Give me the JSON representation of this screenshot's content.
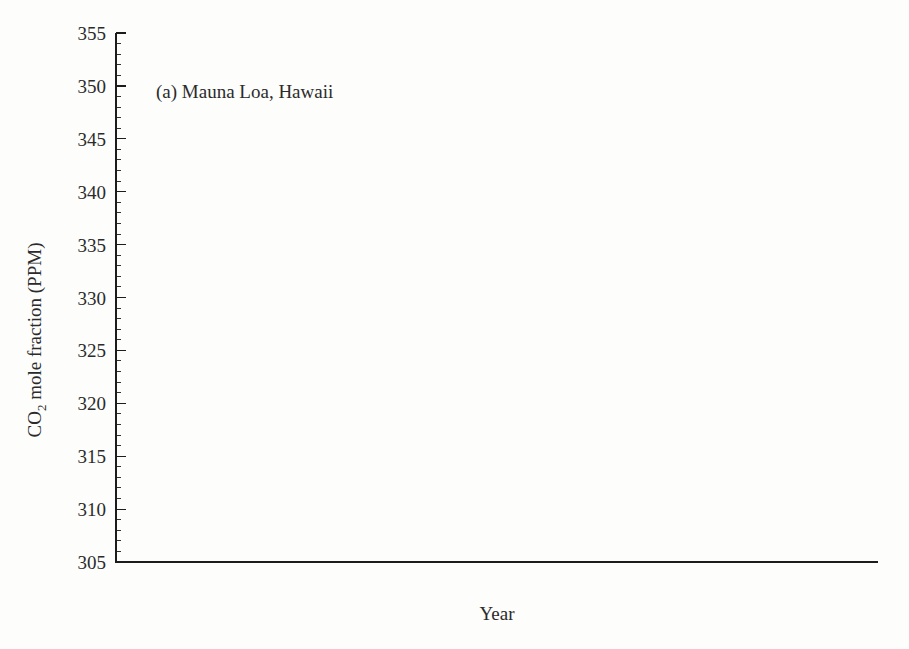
{
  "chart_data": {
    "type": "line",
    "title": "(a) Mauna Loa, Hawaii",
    "panel_letter": "(a)",
    "station": "Mauna Loa, Hawaii",
    "xlabel": "Year",
    "ylabel_prefix": "CO",
    "ylabel_subscript": "2",
    "ylabel_suffix": " mole fraction (PPM)",
    "ylabel": "CO2 mole fraction (PPM)",
    "xlim": [
      57.0,
      85.2
    ],
    "ylim": [
      305,
      355
    ],
    "x_tick_labels": [
      "58",
      "60",
      "62",
      "64",
      "66",
      "68",
      "70",
      "72",
      "74",
      "76",
      "78",
      "80",
      "82",
      "84"
    ],
    "x_tick_values": [
      58,
      60,
      62,
      64,
      66,
      68,
      70,
      72,
      74,
      76,
      78,
      80,
      82,
      84
    ],
    "x_minor_step": 0.25,
    "y_tick_labels": [
      "305",
      "310",
      "315",
      "320",
      "325",
      "330",
      "335",
      "340",
      "345",
      "350",
      "355"
    ],
    "y_tick_values": [
      305,
      310,
      315,
      320,
      325,
      330,
      335,
      340,
      345,
      350,
      355
    ],
    "y_minor_step": 1,
    "grid": false,
    "legend": false,
    "marker": "filled-circle",
    "line_color": "#262626",
    "marker_color": "#111111",
    "series": [
      {
        "name": "Monthly mean CO2 mole fraction",
        "x": [
          1958.208,
          1958.292,
          1958.375,
          1958.458,
          1958.542,
          1958.625,
          1958.708,
          1958.792,
          1958.875,
          1958.958,
          1959.042,
          1959.125,
          1959.208,
          1959.292,
          1959.375,
          1959.458,
          1959.542,
          1959.625,
          1959.708,
          1959.792,
          1959.875,
          1959.958,
          1960.042,
          1960.125,
          1960.208,
          1960.292,
          1960.375,
          1960.458,
          1960.542,
          1960.625,
          1960.708,
          1960.792,
          1960.875,
          1960.958,
          1961.042,
          1961.125,
          1961.208,
          1961.292,
          1961.375,
          1961.458,
          1961.542,
          1961.625,
          1961.708,
          1961.792,
          1961.875,
          1961.958,
          1962.042,
          1962.125,
          1962.208,
          1962.292,
          1962.375,
          1962.458,
          1962.542,
          1962.625,
          1962.708,
          1962.792,
          1962.875,
          1962.958,
          1963.042,
          1963.125,
          1963.208,
          1963.292,
          1963.375,
          1963.458,
          1963.542,
          1963.625,
          1963.708,
          1963.792,
          1963.875,
          1963.958,
          1964.042,
          1964.125,
          1964.208,
          1964.292,
          1964.375,
          1964.458,
          1964.542,
          1964.625,
          1964.708,
          1964.792,
          1964.875,
          1964.958,
          1965.042,
          1965.125,
          1965.208,
          1965.292,
          1965.375,
          1965.458,
          1965.542,
          1965.625,
          1965.708,
          1965.792,
          1965.875,
          1965.958,
          1966.042,
          1966.125,
          1966.208,
          1966.292,
          1966.375,
          1966.458,
          1966.542,
          1966.625,
          1966.708,
          1966.792,
          1966.875,
          1966.958,
          1967.042,
          1967.125,
          1967.208,
          1967.292,
          1967.375,
          1967.458,
          1967.542,
          1967.625,
          1967.708,
          1967.792,
          1967.875,
          1967.958,
          1968.042,
          1968.125,
          1968.208,
          1968.292,
          1968.375,
          1968.458,
          1968.542,
          1968.625,
          1968.708,
          1968.792,
          1968.875,
          1968.958,
          1969.042,
          1969.125,
          1969.208,
          1969.292,
          1969.375,
          1969.458,
          1969.542,
          1969.625,
          1969.708,
          1969.792,
          1969.875,
          1969.958,
          1970.042,
          1970.125,
          1970.208,
          1970.292,
          1970.375,
          1970.458,
          1970.542,
          1970.625,
          1970.708,
          1970.792,
          1970.875,
          1970.958,
          1971.042,
          1971.125,
          1971.208,
          1971.292,
          1971.375,
          1971.458,
          1971.542,
          1971.625,
          1971.708,
          1971.792,
          1971.875,
          1971.958,
          1972.042,
          1972.125,
          1972.208,
          1972.292,
          1972.375,
          1972.458,
          1972.542,
          1972.625,
          1972.708,
          1972.792,
          1972.875,
          1972.958,
          1973.042,
          1973.125,
          1973.208,
          1973.292,
          1973.375,
          1973.458,
          1973.542,
          1973.625,
          1973.708,
          1973.792,
          1973.875,
          1973.958,
          1974.042,
          1974.125,
          1974.208,
          1974.292,
          1974.375,
          1974.458,
          1974.542,
          1974.625,
          1974.708,
          1974.792,
          1974.875,
          1974.958,
          1975.042,
          1975.125,
          1975.208,
          1975.292,
          1975.375,
          1975.458,
          1975.542,
          1975.625,
          1975.708,
          1975.792,
          1975.875,
          1975.958,
          1976.042,
          1976.125,
          1976.208,
          1976.292,
          1976.375,
          1976.458,
          1976.542,
          1976.625,
          1976.708,
          1976.792,
          1976.875,
          1976.958,
          1977.042,
          1977.125,
          1977.208,
          1977.292,
          1977.375,
          1977.458,
          1977.542,
          1977.625,
          1977.708,
          1977.792,
          1977.875,
          1977.958,
          1978.042,
          1978.125,
          1978.208,
          1978.292,
          1978.375,
          1978.458,
          1978.542,
          1978.625,
          1978.708,
          1978.792,
          1978.875,
          1978.958,
          1979.042,
          1979.125,
          1979.208,
          1979.292,
          1979.375,
          1979.458,
          1979.542,
          1979.625,
          1979.708,
          1979.792,
          1979.875,
          1979.958,
          1980.042,
          1980.125,
          1980.208,
          1980.292,
          1980.375,
          1980.458,
          1980.542,
          1980.625,
          1980.708,
          1980.792,
          1980.875,
          1980.958,
          1981.042,
          1981.125,
          1981.208,
          1981.292,
          1981.375,
          1981.458,
          1981.542,
          1981.625,
          1981.708,
          1981.792,
          1981.875,
          1981.958,
          1982.042,
          1982.125,
          1982.208,
          1982.292,
          1982.375,
          1982.458,
          1982.542,
          1982.625,
          1982.708,
          1982.792,
          1982.875,
          1982.958,
          1983.042,
          1983.125,
          1983.208,
          1983.292,
          1983.375,
          1983.458,
          1983.542
        ],
        "y": [
          315.7,
          317.4,
          317.6,
          317.4,
          315.9,
          314.8,
          313.3,
          313.1,
          313.4,
          314.7,
          315.2,
          315.9,
          316.6,
          317.3,
          318.1,
          318.0,
          316.5,
          314.8,
          313.8,
          313.3,
          314.8,
          315.6,
          316.4,
          316.9,
          317.5,
          318.3,
          319.1,
          318.8,
          317.6,
          315.9,
          314.2,
          313.5,
          313.6,
          314.8,
          315.4,
          316.3,
          316.8,
          317.6,
          318.5,
          318.9,
          317.9,
          316.3,
          314.8,
          313.9,
          314.9,
          315.9,
          316.6,
          317.3,
          318.0,
          318.6,
          319.4,
          319.6,
          318.7,
          317.1,
          315.3,
          314.5,
          315.3,
          316.3,
          316.9,
          317.6,
          318.4,
          319.3,
          320.3,
          320.0,
          319.1,
          317.6,
          315.9,
          315.2,
          316.0,
          316.9,
          317.6,
          318.4,
          319.1,
          319.8,
          320.6,
          320.4,
          319.5,
          317.9,
          316.2,
          315.4,
          316.3,
          317.2,
          317.9,
          318.6,
          319.2,
          320.0,
          320.9,
          321.1,
          320.0,
          318.6,
          316.8,
          316.2,
          317.1,
          318.0,
          318.7,
          319.4,
          320.2,
          321.0,
          322.0,
          322.1,
          321.2,
          319.6,
          317.7,
          317.1,
          318.0,
          319.0,
          319.6,
          320.3,
          321.0,
          322.0,
          322.6,
          322.6,
          321.8,
          320.3,
          318.6,
          318.0,
          319.0,
          320.0,
          320.6,
          321.4,
          322.2,
          323.0,
          323.7,
          323.6,
          322.6,
          321.3,
          319.6,
          319.0,
          320.0,
          321.0,
          321.8,
          322.5,
          323.3,
          324.3,
          325.0,
          325.2,
          324.0,
          322.4,
          320.8,
          320.2,
          321.4,
          322.5,
          323.2,
          323.9,
          324.7,
          325.6,
          326.3,
          326.3,
          325.4,
          323.9,
          322.2,
          321.6,
          322.6,
          323.6,
          324.2,
          324.8,
          325.5,
          326.4,
          327.0,
          326.9,
          325.9,
          324.5,
          322.6,
          322.1,
          323.0,
          324.1,
          324.9,
          325.6,
          326.6,
          327.4,
          328.3,
          328.1,
          327.1,
          325.6,
          323.8,
          323.3,
          324.5,
          325.6,
          326.5,
          327.5,
          328.4,
          329.4,
          330.2,
          330.2,
          329.2,
          327.5,
          325.7,
          325.1,
          326.3,
          327.5,
          328.2,
          329.0,
          329.8,
          330.5,
          331.3,
          331.2,
          330.0,
          328.4,
          326.7,
          326.0,
          327.2,
          328.2,
          328.8,
          329.5,
          330.5,
          331.4,
          332.3,
          332.2,
          331.2,
          329.6,
          327.8,
          327.1,
          328.3,
          329.4,
          330.0,
          330.7,
          331.6,
          332.6,
          333.3,
          333.2,
          332.1,
          330.6,
          328.9,
          328.3,
          329.5,
          330.5,
          331.3,
          332.3,
          333.1,
          334.2,
          334.9,
          334.8,
          333.7,
          332.1,
          330.4,
          329.8,
          331.0,
          332.1,
          333.0,
          333.9,
          334.8,
          335.8,
          336.6,
          336.5,
          335.4,
          333.8,
          332.0,
          331.4,
          332.7,
          333.8,
          334.7,
          335.6,
          336.5,
          337.5,
          338.2,
          338.1,
          337.0,
          335.4,
          333.7,
          333.1,
          334.4,
          335.5,
          336.4,
          337.3,
          338.2,
          339.3,
          340.1,
          340.0,
          338.9,
          337.3,
          335.6,
          334.9,
          336.2,
          337.3,
          338.2,
          339.1,
          340.0,
          341.0,
          341.8,
          341.7,
          340.6,
          339.0,
          337.2,
          336.6,
          337.8,
          339.0,
          339.8,
          340.7,
          341.6,
          342.7,
          343.5,
          343.4,
          342.3,
          340.6,
          338.8,
          338.2,
          339.5,
          340.7,
          341.5,
          342.3,
          343.2,
          344.3,
          345.0,
          344.8,
          344.6
        ]
      }
    ]
  },
  "layout": {
    "plot_left": 116,
    "plot_right": 878,
    "plot_top": 33,
    "plot_bottom": 562
  }
}
